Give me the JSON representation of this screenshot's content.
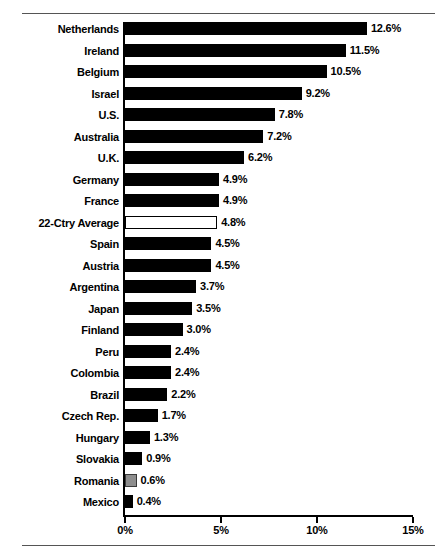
{
  "chart_data": {
    "type": "bar",
    "orientation": "horizontal",
    "title": "",
    "subtitle": "",
    "xlabel": "",
    "ylabel": "",
    "xlim": [
      0,
      15
    ],
    "grid": false,
    "legend": null,
    "xticks": [
      "0%",
      "5%",
      "10%",
      "15%"
    ],
    "xtick_values": [
      0,
      5,
      10,
      15
    ],
    "categories": [
      "Netherlands",
      "Ireland",
      "Belgium",
      "Israel",
      "U.S.",
      "Australia",
      "U.K.",
      "Germany",
      "France",
      "22-Ctry Average",
      "Spain",
      "Austria",
      "Argentina",
      "Japan",
      "Finland",
      "Peru",
      "Colombia",
      "Brazil",
      "Czech Rep.",
      "Hungary",
      "Slovakia",
      "Romania",
      "Mexico"
    ],
    "values": [
      12.6,
      11.5,
      10.5,
      9.2,
      7.8,
      7.2,
      6.2,
      4.9,
      4.9,
      4.8,
      4.5,
      4.5,
      3.7,
      3.5,
      3.0,
      2.4,
      2.4,
      2.2,
      1.7,
      1.3,
      0.9,
      0.6,
      0.4
    ],
    "value_labels": [
      "12.6%",
      "11.5%",
      "10.5%",
      "9.2%",
      "7.8%",
      "7.2%",
      "6.2%",
      "4.9%",
      "4.9%",
      "4.8%",
      "4.5%",
      "4.5%",
      "3.7%",
      "3.5%",
      "3.0%",
      "2.4%",
      "2.4%",
      "2.2%",
      "1.7%",
      "1.3%",
      "0.9%",
      "0.6%",
      "0.4%"
    ],
    "bar_styles": [
      "solid",
      "solid",
      "solid",
      "solid",
      "solid",
      "solid",
      "solid",
      "solid",
      "solid",
      "hollow",
      "solid",
      "solid",
      "solid",
      "solid",
      "solid",
      "solid",
      "solid",
      "solid",
      "solid",
      "solid",
      "solid",
      "grey",
      "solid"
    ],
    "colors": {
      "bar_solid": "#000000",
      "bar_hollow_fill": "#ffffff",
      "bar_hollow_stroke": "#000000",
      "bar_grey_fill": "#8e8e8e",
      "bar_grey_stroke": "#3a3a3a",
      "axis": "#000000",
      "text": "#000000",
      "rule": "#555555",
      "background": "#ffffff"
    }
  }
}
